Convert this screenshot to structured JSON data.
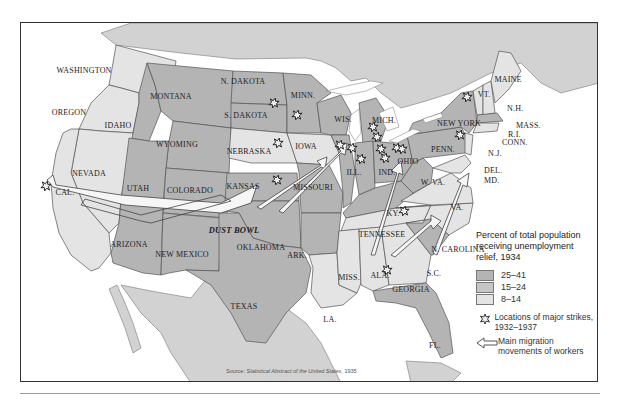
{
  "colors": {
    "high_relief": "#b4b4b4",
    "mid_relief": "#c6c6c6",
    "low_relief": "#e4e4e4",
    "foreign_land": "#d2d2d2",
    "water": "#ffffff",
    "border": "#555555"
  },
  "legend": {
    "title": "Percent of total population receiving unemployment relief, 1934",
    "categories": [
      {
        "label": "25–41",
        "color": "#b4b4b4"
      },
      {
        "label": "15–24",
        "color": "#c6c6c6"
      },
      {
        "label": "8–14",
        "color": "#e4e4e4"
      }
    ],
    "strike_symbol_label": "Locations of major strikes, 1932–1937",
    "migration_symbol_label": "Main migration movements of workers"
  },
  "source": {
    "prefix": "Source:",
    "title": "Statistical Abstract of the United States,",
    "year": "1935"
  },
  "region_label": "DUST BOWL",
  "states": [
    {
      "name": "WASHINGTON",
      "x": 63,
      "y": 47,
      "cat": "8–14"
    },
    {
      "name": "OREGON",
      "x": 48,
      "y": 89,
      "cat": "8–14"
    },
    {
      "name": "IDAHO",
      "x": 97,
      "y": 102,
      "cat": "25–41"
    },
    {
      "name": "MONTANA",
      "x": 150,
      "y": 73,
      "cat": "25–41"
    },
    {
      "name": "WYOMING",
      "x": 156,
      "y": 121,
      "cat": "25–41"
    },
    {
      "name": "NEVADA",
      "x": 68,
      "y": 150,
      "cat": "8–14"
    },
    {
      "name": "UTAH",
      "x": 117,
      "y": 165,
      "cat": "25–41"
    },
    {
      "name": "COLORADO",
      "x": 169,
      "y": 167,
      "cat": "25–41"
    },
    {
      "name": "CAL.",
      "x": 44,
      "y": 169,
      "cat": "8–14"
    },
    {
      "name": "ARIZONA",
      "x": 108,
      "y": 221,
      "cat": "25–41"
    },
    {
      "name": "NEW MEXICO",
      "x": 161,
      "y": 231,
      "cat": "25–41"
    },
    {
      "name": "N. DAKOTA",
      "x": 222,
      "y": 58,
      "cat": "25–41"
    },
    {
      "name": "S. DAKOTA",
      "x": 225,
      "y": 92,
      "cat": "25–41"
    },
    {
      "name": "NEBRASKA",
      "x": 228,
      "y": 128,
      "cat": "8–14"
    },
    {
      "name": "KANSAS",
      "x": 222,
      "y": 163,
      "cat": "25–41"
    },
    {
      "name": "OKLAHOMA",
      "x": 240,
      "y": 224,
      "cat": "25–41"
    },
    {
      "name": "TEXAS",
      "x": 223,
      "y": 283,
      "cat": "25–41"
    },
    {
      "name": "MINN.",
      "x": 282,
      "y": 72,
      "cat": "25–41"
    },
    {
      "name": "IOWA",
      "x": 285,
      "y": 123,
      "cat": "8–14"
    },
    {
      "name": "MISSOURI",
      "x": 292,
      "y": 164,
      "cat": "25–41"
    },
    {
      "name": "ARK.",
      "x": 276,
      "y": 232,
      "cat": "25–41"
    },
    {
      "name": "LA.",
      "x": 309,
      "y": 296,
      "cat": "8–14"
    },
    {
      "name": "WIS.",
      "x": 322,
      "y": 96,
      "cat": "25–41"
    },
    {
      "name": "ILL.",
      "x": 333,
      "y": 149,
      "cat": "25–41"
    },
    {
      "name": "MICH.",
      "x": 363,
      "y": 97,
      "cat": "25–41"
    },
    {
      "name": "IND.",
      "x": 366,
      "y": 149,
      "cat": "25–41"
    },
    {
      "name": "OHIO",
      "x": 387,
      "y": 138,
      "cat": "25–41"
    },
    {
      "name": "KY.",
      "x": 372,
      "y": 190,
      "cat": "25–41"
    },
    {
      "name": "TENNESSEE",
      "x": 361,
      "y": 211,
      "cat": "8–14"
    },
    {
      "name": "MISS.",
      "x": 328,
      "y": 254,
      "cat": "8–14"
    },
    {
      "name": "ALA.",
      "x": 359,
      "y": 252,
      "cat": "8–14"
    },
    {
      "name": "GEORGIA",
      "x": 390,
      "y": 266,
      "cat": "8–14"
    },
    {
      "name": "FL.",
      "x": 414,
      "y": 322,
      "cat": "25–41"
    },
    {
      "name": "S.C.",
      "x": 413,
      "y": 250,
      "cat": "25–41"
    },
    {
      "name": "N. CAROLINA",
      "x": 437,
      "y": 226,
      "cat": "8–14"
    },
    {
      "name": "W. VA.",
      "x": 412,
      "y": 159,
      "cat": "25–41"
    },
    {
      "name": "VA.",
      "x": 436,
      "y": 184,
      "cat": "8–14"
    },
    {
      "name": "PENN.",
      "x": 422,
      "y": 126,
      "cat": "25–41"
    },
    {
      "name": "NEW YORK",
      "x": 438,
      "y": 100,
      "cat": "25–41"
    },
    {
      "name": "VT.",
      "x": 463,
      "y": 71,
      "cat": "8–14"
    },
    {
      "name": "MAINE",
      "x": 487,
      "y": 56,
      "cat": "8–14"
    }
  ],
  "callouts": [
    {
      "name": "N.H.",
      "x": 486,
      "y": 85
    },
    {
      "name": "MASS.",
      "x": 495,
      "y": 102
    },
    {
      "name": "R.I.",
      "x": 487,
      "y": 111
    },
    {
      "name": "CONN.",
      "x": 481,
      "y": 119
    },
    {
      "name": "N.J.",
      "x": 467,
      "y": 130
    },
    {
      "name": "DEL.",
      "x": 463,
      "y": 147
    },
    {
      "name": "MD.",
      "x": 463,
      "y": 157
    }
  ],
  "strikes": [
    {
      "x": 25,
      "y": 163
    },
    {
      "x": 253,
      "y": 80
    },
    {
      "x": 276,
      "y": 92
    },
    {
      "x": 257,
      "y": 120
    },
    {
      "x": 256,
      "y": 157
    },
    {
      "x": 319,
      "y": 122
    },
    {
      "x": 331,
      "y": 125
    },
    {
      "x": 352,
      "y": 104
    },
    {
      "x": 356,
      "y": 114
    },
    {
      "x": 360,
      "y": 126
    },
    {
      "x": 376,
      "y": 125
    },
    {
      "x": 381,
      "y": 126
    },
    {
      "x": 364,
      "y": 135
    },
    {
      "x": 340,
      "y": 136
    },
    {
      "x": 383,
      "y": 188
    },
    {
      "x": 446,
      "y": 74
    },
    {
      "x": 439,
      "y": 112
    },
    {
      "x": 366,
      "y": 247
    }
  ]
}
